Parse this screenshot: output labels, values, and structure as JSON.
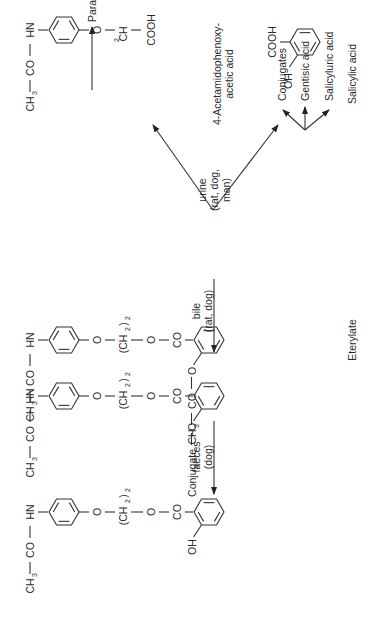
{
  "diagram": {
    "compounds": {
      "eterylate": {
        "label": "Eterylate",
        "acyl": [
          "HN",
          "CO",
          "CH",
          "3"
        ],
        "chain": [
          "O",
          "(CH",
          "2",
          ")",
          "2",
          "O",
          "CO"
        ],
        "ring_sub": [
          "O",
          "CO",
          "CH",
          "3"
        ]
      },
      "bile_product": {
        "acyl": [
          "HN",
          "CO",
          "CH",
          "3"
        ],
        "chain": [
          "O",
          "(CH",
          "2",
          ")",
          "2",
          "O",
          "CO"
        ],
        "ring_sub": [
          "O",
          "Conjugate"
        ]
      },
      "faeces_product": {
        "acyl": [
          "HN",
          "CO",
          "CH",
          "3"
        ],
        "chain": [
          "O",
          "(CH",
          "2",
          ")",
          "2",
          "O",
          "CO"
        ],
        "ring_sub": [
          "OH"
        ]
      },
      "acetamidophenoxyacetic_acid": {
        "label_line1": "4-Acetamidophenoxy-",
        "label_line2": "acetic acid",
        "acyl": [
          "HN",
          "CO",
          "CH",
          "3"
        ],
        "chain": [
          "O",
          "CH",
          "2",
          "COOH"
        ]
      },
      "salicylic_acid": {
        "label": "Salicylic acid",
        "groups": [
          "COOH",
          "OH"
        ]
      }
    },
    "routes": {
      "urine": [
        "urine",
        "(rat, dog,",
        "man)"
      ],
      "bile": [
        "bile",
        "(rat, dog)"
      ],
      "faeces": [
        "faeces",
        "(dog)"
      ]
    },
    "products": {
      "paracetamol": "Paracetamol",
      "salicylic_metabolites": [
        "Conjugates",
        "Gentisic acid",
        "Salicyluric acid"
      ]
    }
  }
}
